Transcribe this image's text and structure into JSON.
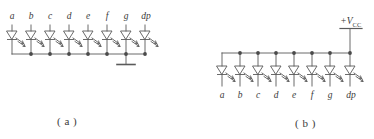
{
  "figure": {
    "title_bleed": "▫ ▫ ▫ ▫ ▫ ▫ ▫ ▫ ▫",
    "background_color": "#ffffff",
    "line_color": "#5a5a5a",
    "text_color": "#3a3a3a"
  },
  "panel_a": {
    "caption": "( a )",
    "configuration": "common-cathode",
    "segment_labels": [
      "a",
      "b",
      "c",
      "d",
      "e",
      "f",
      "g",
      "dp"
    ],
    "label_position": "top",
    "led_count": 8,
    "ground_symbol": true,
    "supply_label": null
  },
  "panel_b": {
    "caption": "( b )",
    "configuration": "common-anode",
    "segment_labels": [
      "a",
      "b",
      "c",
      "d",
      "e",
      "f",
      "g",
      "dp"
    ],
    "label_position": "bottom",
    "led_count": 8,
    "ground_symbol": false,
    "supply_label": "+V",
    "supply_subscript": "CC"
  }
}
